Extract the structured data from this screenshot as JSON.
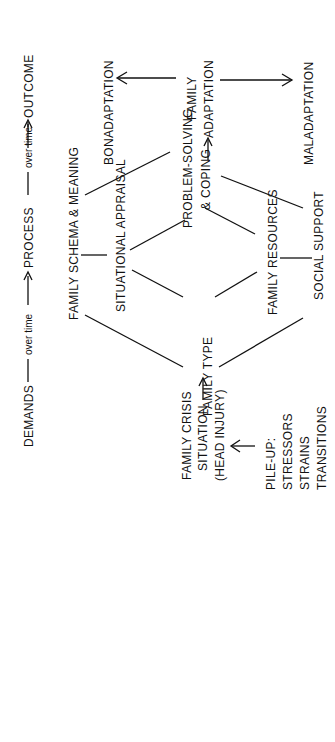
{
  "diagram": {
    "type": "flow-model",
    "orientation": "rotated-90-ccw",
    "timeline": {
      "demands": "DEMANDS",
      "over_time_1": "over time",
      "process": "PROCESS",
      "over_time_2": "over time",
      "outcome": "OUTCOME"
    },
    "nodes": {
      "pileup": [
        "PILE-UP:",
        "STRESSORS",
        "STRAINS",
        "TRANSITIONS"
      ],
      "crisis": [
        "FAMILY CRISIS",
        "SITUATION",
        "(HEAD INJURY)"
      ],
      "family_type": "FAMILY TYPE",
      "schema": "FAMILY SCHEMA & MEANING",
      "appraisal": "SITUATIONAL APPRAISAL",
      "resources": "FAMILY RESOURCES",
      "social_support": "SOCIAL SUPPORT",
      "problem_solving": [
        "PROBLEM-SOLVING",
        "& COPING"
      ],
      "adaptation": [
        "FAMILY",
        "ADAPTATION"
      ],
      "bonadaptation": "BONADAPTATION",
      "maladaptation": "MALADAPTATION"
    },
    "edges": [
      {
        "from": "pileup",
        "to": "crisis",
        "arrow": true
      },
      {
        "from": "crisis",
        "to": "family_type",
        "arrow": true
      },
      {
        "from": "family_type",
        "to": "schema"
      },
      {
        "from": "family_type",
        "to": "appraisal"
      },
      {
        "from": "family_type",
        "to": "resources"
      },
      {
        "from": "family_type",
        "to": "social_support"
      },
      {
        "from": "schema",
        "to": "appraisal"
      },
      {
        "from": "resources",
        "to": "social_support"
      },
      {
        "from": "appraisal",
        "to": "problem_solving"
      },
      {
        "from": "resources",
        "to": "problem_solving"
      },
      {
        "from": "schema",
        "to": "problem_solving"
      },
      {
        "from": "social_support",
        "to": "problem_solving"
      },
      {
        "from": "problem_solving",
        "to": "adaptation",
        "arrow": true
      },
      {
        "from": "adaptation",
        "to": "bonadaptation",
        "arrow": true
      },
      {
        "from": "adaptation",
        "to": "maladaptation",
        "arrow": true
      }
    ]
  }
}
